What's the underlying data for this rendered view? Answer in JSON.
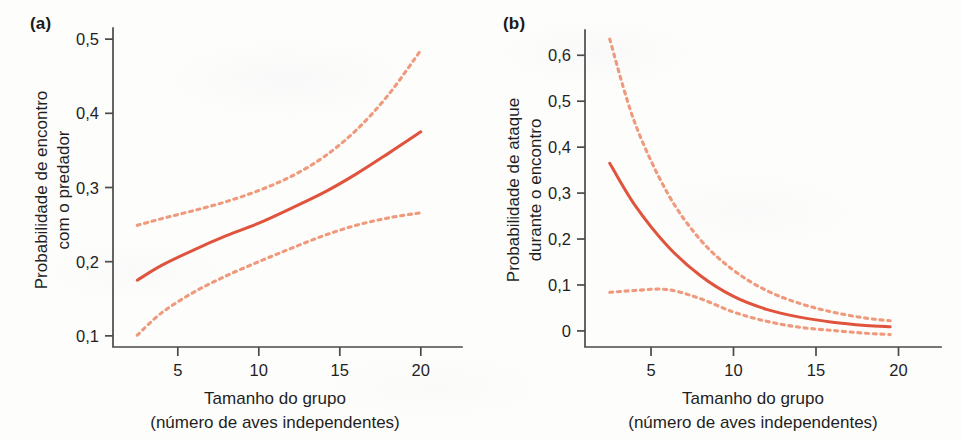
{
  "figure": {
    "background_color": "#fdfdfc",
    "solid_color": "#e0533c",
    "dashed_color": "#ef9a7c",
    "axis_color": "#4a4a4a",
    "text_color": "#1f1f1f"
  },
  "panels": [
    {
      "id": "a",
      "label": "(a)",
      "ylabel_lines": [
        "Probabilidade de encontro",
        "com o predador"
      ],
      "xlabel_lines": [
        "Tamanho do grupo",
        "(número de aves independentes)"
      ],
      "yticks": [
        "0,1",
        "0,2",
        "0,3",
        "0,4",
        "0,5"
      ],
      "xticks": [
        "5",
        "10",
        "15",
        "20"
      ]
    },
    {
      "id": "b",
      "label": "(b)",
      "ylabel_lines": [
        "Probabilidade de ataque",
        "durante o encontro"
      ],
      "xlabel_lines": [
        "Tamanho do grupo",
        "(número de aves independentes)"
      ],
      "yticks": [
        "0",
        "0,1",
        "0,2",
        "0,3",
        "0,4",
        "0,5",
        "0,6"
      ],
      "xticks": [
        "5",
        "10",
        "15",
        "20"
      ]
    }
  ],
  "chart_data": [
    {
      "type": "line",
      "panel": "a",
      "title": "",
      "xlabel": "Tamanho do grupo (número de aves independentes)",
      "ylabel": "Probabilidade de encontro com o predador",
      "xlim": [
        1.0,
        21.0
      ],
      "ylim": [
        0.085,
        0.515
      ],
      "xticks": [
        5,
        10,
        15,
        20
      ],
      "yticks": [
        0.1,
        0.2,
        0.3,
        0.4,
        0.5
      ],
      "xtick_labels": [
        "5",
        "10",
        "15",
        "20"
      ],
      "ytick_labels": [
        "0,1",
        "0,2",
        "0,3",
        "0,4",
        "0,5"
      ],
      "grid": false,
      "legend": "none",
      "x": [
        2.5,
        4,
        6,
        8,
        10,
        12,
        14,
        16,
        18,
        20
      ],
      "series": [
        {
          "name": "Estimativa (linha sólida)",
          "style": "solid",
          "color": "#e0533c",
          "values": [
            0.175,
            0.195,
            0.216,
            0.235,
            0.252,
            0.272,
            0.293,
            0.318,
            0.346,
            0.375
          ]
        },
        {
          "name": "Limite superior do intervalo de confiança",
          "style": "dotted",
          "color": "#ef9a7c",
          "values": [
            0.249,
            0.258,
            0.269,
            0.281,
            0.296,
            0.315,
            0.341,
            0.377,
            0.425,
            0.485
          ]
        },
        {
          "name": "Limite inferior do intervalo de confiança",
          "style": "dotted",
          "color": "#ef9a7c",
          "values": [
            0.101,
            0.131,
            0.159,
            0.181,
            0.2,
            0.218,
            0.235,
            0.249,
            0.259,
            0.266
          ]
        }
      ]
    },
    {
      "type": "line",
      "panel": "b",
      "title": "",
      "xlabel": "Tamanho do grupo (número de aves independentes)",
      "ylabel": "Probabilidade de ataque durante o encontro",
      "xlim": [
        1.0,
        21.0
      ],
      "ylim": [
        -0.035,
        0.655
      ],
      "xticks": [
        5,
        10,
        15,
        20
      ],
      "yticks": [
        0,
        0.1,
        0.2,
        0.3,
        0.4,
        0.5,
        0.6
      ],
      "xtick_labels": [
        "5",
        "10",
        "15",
        "20"
      ],
      "ytick_labels": [
        "0",
        "0,1",
        "0,2",
        "0,3",
        "0,4",
        "0,5",
        "0,6"
      ],
      "grid": false,
      "legend": "none",
      "x": [
        2.5,
        4,
        6,
        8,
        10,
        12,
        14,
        16,
        18,
        19.5
      ],
      "series": [
        {
          "name": "Estimativa (linha sólida)",
          "style": "solid",
          "color": "#e0533c",
          "values": [
            0.365,
            0.275,
            0.185,
            0.12,
            0.075,
            0.047,
            0.03,
            0.019,
            0.012,
            0.009
          ]
        },
        {
          "name": "Limite superior do intervalo de confiança",
          "style": "dotted",
          "color": "#ef9a7c",
          "values": [
            0.635,
            0.455,
            0.3,
            0.198,
            0.132,
            0.088,
            0.06,
            0.041,
            0.028,
            0.022
          ]
        },
        {
          "name": "Limite inferior do intervalo de confiança",
          "style": "dotted",
          "color": "#ef9a7c",
          "values": [
            0.084,
            0.088,
            0.09,
            0.07,
            0.041,
            0.021,
            0.008,
            0.001,
            -0.005,
            -0.008
          ]
        }
      ]
    }
  ]
}
